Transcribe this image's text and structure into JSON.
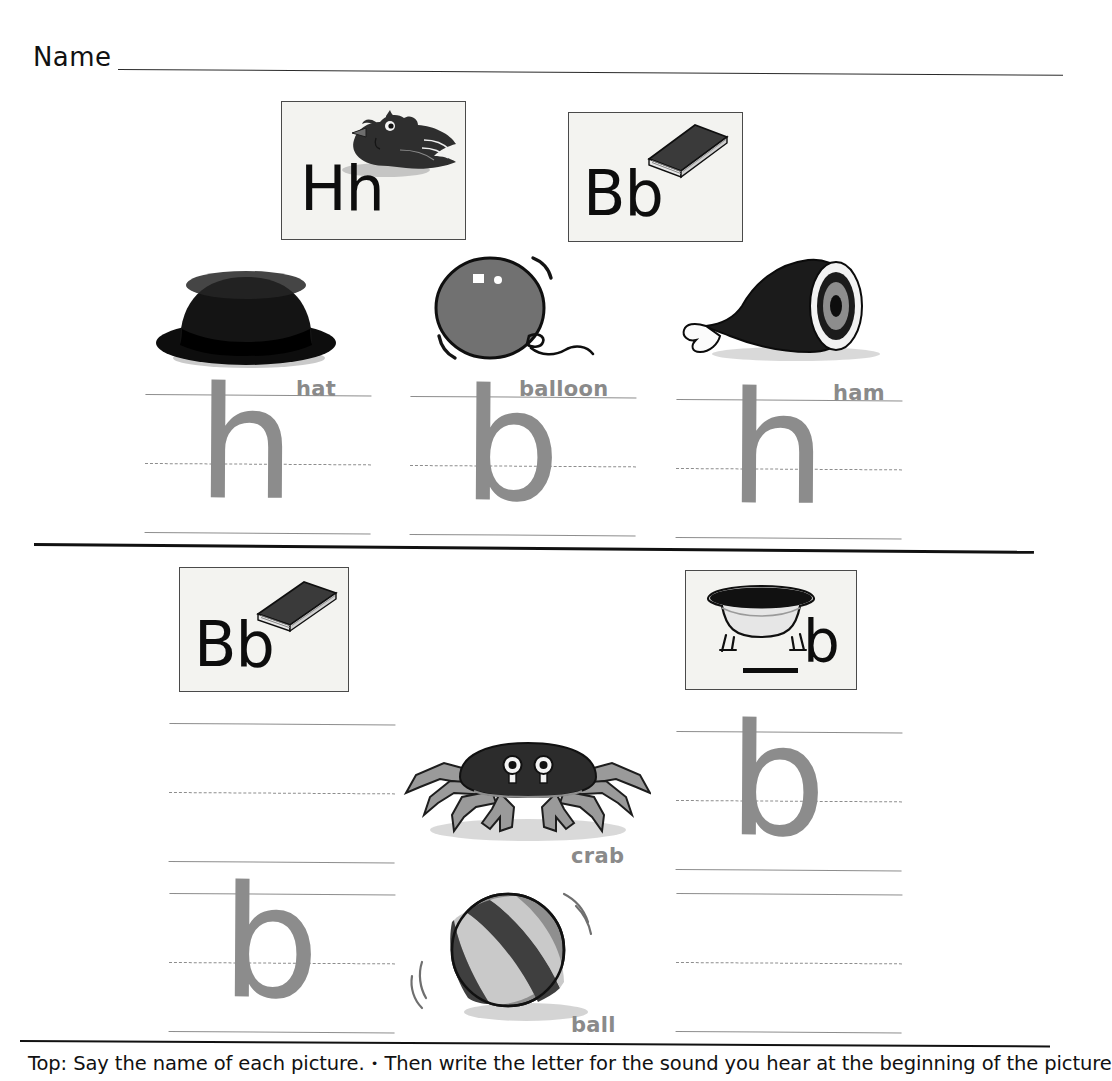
{
  "worksheet": {
    "name_label": "Name",
    "footer_instruction_part1": "Top: Say the name of each picture.",
    "footer_bullet": "•",
    "footer_instruction_part2": "Then write the letter for the sound you hear at the beginning of the picture"
  },
  "top_section": {
    "cards": [
      {
        "letter": "Hh",
        "picture": "hen-icon"
      },
      {
        "letter": "Bb",
        "picture": "book-icon"
      }
    ],
    "items": [
      {
        "label": "hat",
        "picture": "hat-icon",
        "practice_letter": "h"
      },
      {
        "label": "balloon",
        "picture": "balloon-icon",
        "practice_letter": "b"
      },
      {
        "label": "ham",
        "picture": "ham-icon",
        "practice_letter": "h"
      }
    ]
  },
  "bottom_section": {
    "cards": [
      {
        "letter": "Bb",
        "picture": "book-icon",
        "blank": ""
      },
      {
        "letter": "b",
        "picture": "bathtub-icon",
        "blank": "___"
      }
    ],
    "items": [
      {
        "label": "",
        "picture": "",
        "practice_letter": ""
      },
      {
        "label": "crab",
        "picture": "crab-icon",
        "practice_letter": "b"
      },
      {
        "label": "ball",
        "picture": "ball-icon",
        "practice_letter": "b"
      },
      {
        "label": "",
        "picture": "",
        "practice_letter": ""
      }
    ]
  },
  "colors": {
    "line_gray": "#8d8d8d",
    "glyph_gray": "#8c8c8c",
    "label_gray": "#8a8a8a",
    "ink_black": "#111111",
    "card_bg": "#f3f3f0"
  }
}
